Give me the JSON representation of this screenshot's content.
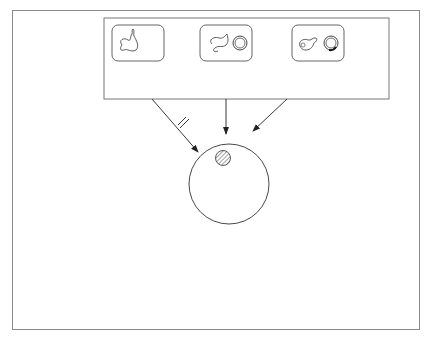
{
  "source_box": {
    "label_lines": [
      "Nährlösung",
      "mit klonierten",
      "Bakterien",
      "vom Typ "
    ],
    "label_italic": "E. coli",
    "cells": [
      {
        "id": "ohne-plasmid",
        "icon": "bacterium-no-plasmid-icon",
        "lines": [
          "ohne Plasmid"
        ]
      },
      {
        "id": "mit-plasmid",
        "icon": "bacterium-with-plasmid-icon",
        "lines": [
          "mit Plasmid",
          "(Tetracyclin- und",
          "Ampicillin-Resistenz)"
        ]
      },
      {
        "id": "mit-hybridplasmid",
        "icon": "bacterium-with-hybridplasmid-icon",
        "lines": [
          "mit Hybridplasmid",
          "(daher nur Ampicillin-",
          "Resistenz)"
        ]
      }
    ]
  },
  "arrows": {
    "no_growth": [
      "kein",
      "Wachstum"
    ],
    "transfer": [
      "Übertragung auf",
      "antibiotikahaltige",
      "Nährböden"
    ],
    "colony_transfer": "Koloniemuster übertragen (Stempeltechnik)"
  },
  "plates": [
    {
      "id": "ampicillin",
      "label": "Agar-Platte mit Ampicillin"
    },
    {
      "id": "tetracyclin",
      "label": "Agar-Platte mit Tetracyclin"
    }
  ],
  "side_notes": {
    "tnf": [
      "Kolonien mit TNF-Gen;",
      "isolieren, vermehren"
    ],
    "hybrid": [
      "Bakterien mit",
      "Hybridplasmid (×)",
      "wachsen nicht"
    ]
  },
  "colors": {
    "line": "#333333",
    "frame": "#8a8a8a",
    "hatch": "#444444"
  }
}
